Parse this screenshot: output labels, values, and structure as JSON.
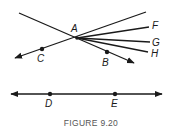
{
  "figure": {
    "caption": "FIGURE 9.20",
    "colors": {
      "ink": "#1a1a1a",
      "caption": "#555555",
      "background": "#ffffff"
    }
  },
  "points": {
    "A": {
      "label": "A"
    },
    "B": {
      "label": "B"
    },
    "C": {
      "label": "C"
    },
    "D": {
      "label": "D"
    },
    "E": {
      "label": "E"
    },
    "F": {
      "label": "F"
    },
    "G": {
      "label": "G"
    },
    "H": {
      "label": "H"
    }
  },
  "elements": {
    "line_AB": "ray from upper-left through A to B (arrow past B)",
    "line_AC": "line through C and A extending to upper-right (arrow past C)",
    "ray_AF": "segment from A toward F",
    "ray_AG": "segment from A toward G",
    "ray_AH": "segment from A toward H",
    "line_DE": "line through D and E with arrows on both ends"
  }
}
